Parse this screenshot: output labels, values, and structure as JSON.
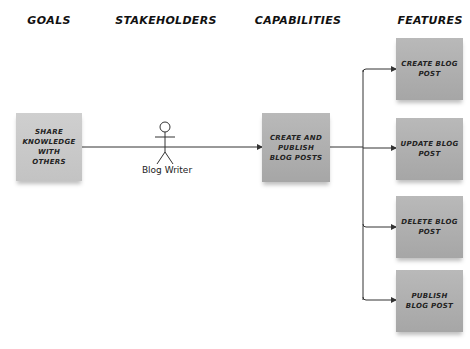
{
  "columns": {
    "goals": "GOALS",
    "stakeholders": "STAKEHOLDERS",
    "capabilities": "CAPABILITIES",
    "features": "FEATURES"
  },
  "goal": {
    "label": "SHARE KNOWLEDGE WITH OTHERS"
  },
  "stakeholder": {
    "label": "Blog Writer",
    "icon": "stick-figure-actor-icon"
  },
  "capability": {
    "label": "CREATE AND PUBLISH BLOG POSTS"
  },
  "features": [
    {
      "label": "CREATE BLOG POST"
    },
    {
      "label": "UPDATE BLOG POST"
    },
    {
      "label": "DELETE BLOG POST"
    },
    {
      "label": "PUBLISH BLOG POST"
    }
  ],
  "colors": {
    "note_fill": "#aeaeae",
    "goal_note_fill": "#c8c8c8",
    "connector": "#333333",
    "text": "#222222"
  }
}
